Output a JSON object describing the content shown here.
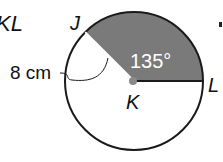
{
  "diagram": {
    "title_fragment": "KL",
    "points": {
      "J": "J",
      "K": "K",
      "L": "L"
    },
    "radius_label": "8 cm",
    "angle_label": "135°",
    "colors": {
      "sector_fill": "#7a7a7a",
      "center_dot": "#8a8a8a",
      "stroke": "#1a1a1a",
      "angle_text": "#ffffff"
    }
  }
}
